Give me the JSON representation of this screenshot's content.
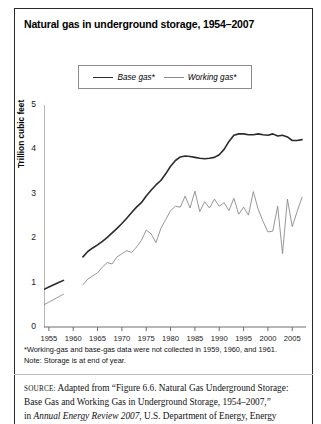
{
  "figure": {
    "title": "Natural gas in underground storage, 1954–2007",
    "footnote_line1": "*Working-gas and base-gas data were not collected in 1959, 1960, and 1961.",
    "footnote_line2": "Note: Storage is at end of year.",
    "source_label": "SOURCE:",
    "source_line1": " Adapted from “Figure 6.6. Natural Gas Underground Storage:",
    "source_line2": "Base Gas and Working Gas in Underground Storage, 1954–2007,”",
    "source_line3_pre": "in ",
    "source_line3_italic": "Annual Energy Review 2007",
    "source_line3_post": ", U.S. Department of Energy, Energy"
  },
  "colors": {
    "base_gas_line": "#2b2b2b",
    "working_gas_line": "#8a8a8a",
    "axis": "#6e6e6e",
    "text": "#111111",
    "frame": "#2a2a2a"
  },
  "chart_data": {
    "type": "line",
    "title": "Natural gas in underground storage, 1954–2007",
    "xlabel": "",
    "ylabel": "Trillion cubic feet",
    "xlim": [
      1954,
      2007
    ],
    "ylim": [
      0,
      5
    ],
    "yticks": [
      0,
      1,
      2,
      3,
      4,
      5
    ],
    "ytick_labels": [
      "0",
      "1",
      "2",
      "3",
      "4",
      "5"
    ],
    "xticks": [
      1955,
      1960,
      1965,
      1970,
      1975,
      1980,
      1985,
      1990,
      1995,
      2000,
      2005
    ],
    "xtick_labels": [
      "1955",
      "1960",
      "1965",
      "1970",
      "1975",
      "1980",
      "1985",
      "1990",
      "1995",
      "2000",
      "2005"
    ],
    "grid": false,
    "legend": [
      "Base gas*",
      "Working gas*"
    ],
    "legend_position": "top-center",
    "missing_years": [
      1959,
      1960,
      1961
    ],
    "series": [
      {
        "name": "Base gas*",
        "style": "thick",
        "color": "#2b2b2b",
        "x": [
          1954,
          1955,
          1956,
          1957,
          1958,
          1962,
          1963,
          1964,
          1965,
          1966,
          1967,
          1968,
          1969,
          1970,
          1971,
          1972,
          1973,
          1974,
          1975,
          1976,
          1977,
          1978,
          1979,
          1980,
          1981,
          1982,
          1983,
          1984,
          1985,
          1986,
          1987,
          1988,
          1989,
          1990,
          1991,
          1992,
          1993,
          1994,
          1995,
          1996,
          1997,
          1998,
          1999,
          2000,
          2001,
          2002,
          2003,
          2004,
          2005,
          2006,
          2007
        ],
        "values": [
          0.85,
          0.9,
          0.95,
          1.0,
          1.05,
          1.58,
          1.7,
          1.78,
          1.85,
          1.93,
          2.02,
          2.12,
          2.22,
          2.33,
          2.45,
          2.58,
          2.7,
          2.8,
          2.95,
          3.08,
          3.2,
          3.3,
          3.45,
          3.62,
          3.75,
          3.83,
          3.85,
          3.84,
          3.82,
          3.8,
          3.79,
          3.8,
          3.82,
          3.88,
          4.0,
          4.18,
          4.32,
          4.35,
          4.35,
          4.33,
          4.33,
          4.35,
          4.33,
          4.32,
          4.35,
          4.3,
          4.32,
          4.28,
          4.2,
          4.2,
          4.22
        ]
      },
      {
        "name": "Working gas*",
        "style": "thin",
        "color": "#8a8a8a",
        "x": [
          1954,
          1955,
          1956,
          1957,
          1958,
          1962,
          1963,
          1964,
          1965,
          1966,
          1967,
          1968,
          1969,
          1970,
          1971,
          1972,
          1973,
          1974,
          1975,
          1976,
          1977,
          1978,
          1979,
          1980,
          1981,
          1982,
          1983,
          1984,
          1985,
          1986,
          1987,
          1988,
          1989,
          1990,
          1991,
          1992,
          1993,
          1994,
          1995,
          1996,
          1997,
          1998,
          1999,
          2000,
          2001,
          2002,
          2003,
          2004,
          2005,
          2006,
          2007
        ],
        "values": [
          0.5,
          0.56,
          0.62,
          0.68,
          0.74,
          0.95,
          1.08,
          1.15,
          1.22,
          1.35,
          1.45,
          1.42,
          1.58,
          1.65,
          1.72,
          1.68,
          1.8,
          1.95,
          2.18,
          2.1,
          1.9,
          2.22,
          2.42,
          2.62,
          2.72,
          2.7,
          2.95,
          2.68,
          3.06,
          2.6,
          2.82,
          2.68,
          2.88,
          2.72,
          2.8,
          2.62,
          2.9,
          2.54,
          2.7,
          2.52,
          3.05,
          2.65,
          2.38,
          2.14,
          2.16,
          2.72,
          1.65,
          2.88,
          2.26,
          2.6,
          2.92
        ]
      }
    ]
  }
}
